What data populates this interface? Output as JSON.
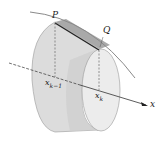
{
  "diagram": {
    "labels": {
      "point_p": "P",
      "point_q": "Q",
      "left_base": "x",
      "left_base_sub": "k−1",
      "right_base": "x",
      "right_base_sub": "k",
      "axis": "x"
    },
    "colors": {
      "surface": "#dcdcdc",
      "surface_dark": "#b8b8b8",
      "band": "#a9a9a9",
      "end_face": "#ececec",
      "curve": "#8a8a8a",
      "segment": "#222222",
      "axis": "#333333"
    }
  }
}
